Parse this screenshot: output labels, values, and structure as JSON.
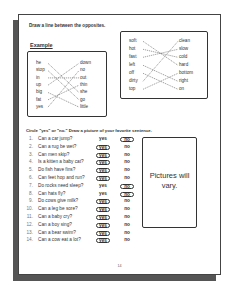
{
  "instruction_opposites": "Draw a line between the opposites.",
  "example_label": "Example",
  "example": {
    "left": [
      "he",
      "stop",
      "in",
      "up",
      "big",
      "fat",
      "yes"
    ],
    "right": [
      "down",
      "no",
      "out",
      "thin",
      "she",
      "go",
      "little"
    ],
    "matches": [
      [
        0,
        4
      ],
      [
        1,
        5
      ],
      [
        2,
        2
      ],
      [
        3,
        0
      ],
      [
        4,
        6
      ],
      [
        5,
        3
      ],
      [
        6,
        1
      ]
    ]
  },
  "exercise": {
    "left": [
      "soft",
      "hot",
      "fast",
      "left",
      "off",
      "dirty",
      "top"
    ],
    "right": [
      "clean",
      "slow",
      "cold",
      "hard",
      "bottom",
      "right",
      "on"
    ],
    "matches": [
      [
        0,
        3
      ],
      [
        1,
        2
      ],
      [
        2,
        1
      ],
      [
        3,
        5
      ],
      [
        4,
        6
      ],
      [
        5,
        0
      ],
      [
        6,
        4
      ]
    ]
  },
  "instruction_yesno": "Circle \"yes\" or \"no.\" Draw a picture of your favorite sentence.",
  "questions": [
    {
      "num": "1.",
      "text": "Can a car jump?",
      "yes": "yes",
      "no": "no",
      "answer": "no"
    },
    {
      "num": "2.",
      "text": "Can a rug be wet?",
      "yes": "yes",
      "no": "no",
      "answer": "yes"
    },
    {
      "num": "3.",
      "text": "Can men skip?",
      "yes": "yes",
      "no": "no",
      "answer": "yes"
    },
    {
      "num": "4.",
      "text": "Is a kitten a baby cat?",
      "yes": "yes",
      "no": "no",
      "answer": "yes"
    },
    {
      "num": "5.",
      "text": "Do fish have fins?",
      "yes": "yes",
      "no": "no",
      "answer": "yes"
    },
    {
      "num": "6.",
      "text": "Can feet hop and run?",
      "yes": "yes",
      "no": "no",
      "answer": "yes"
    },
    {
      "num": "7.",
      "text": "Do rocks need sleep?",
      "yes": "yes",
      "no": "no",
      "answer": "no"
    },
    {
      "num": "8.",
      "text": "Can hats fly?",
      "yes": "yes",
      "no": "no",
      "answer": "no"
    },
    {
      "num": "9.",
      "text": "Do cows give milk?",
      "yes": "yes",
      "no": "no",
      "answer": "yes"
    },
    {
      "num": "10.",
      "text": "Can a leg be sore?",
      "yes": "yes",
      "no": "no",
      "answer": "yes"
    },
    {
      "num": "11.",
      "text": "Can a baby cry?",
      "yes": "yes",
      "no": "no",
      "answer": "yes"
    },
    {
      "num": "12.",
      "text": "Can a boy sing?",
      "yes": "yes",
      "no": "no",
      "answer": "yes"
    },
    {
      "num": "13.",
      "text": "Can a bear swim?",
      "yes": "yes",
      "no": "no",
      "answer": "yes"
    },
    {
      "num": "14.",
      "text": "Can a cow eat a lot?",
      "yes": "yes",
      "no": "no",
      "answer": "yes"
    }
  ],
  "picture_note": "Pictures will vary.",
  "page_number": "14"
}
